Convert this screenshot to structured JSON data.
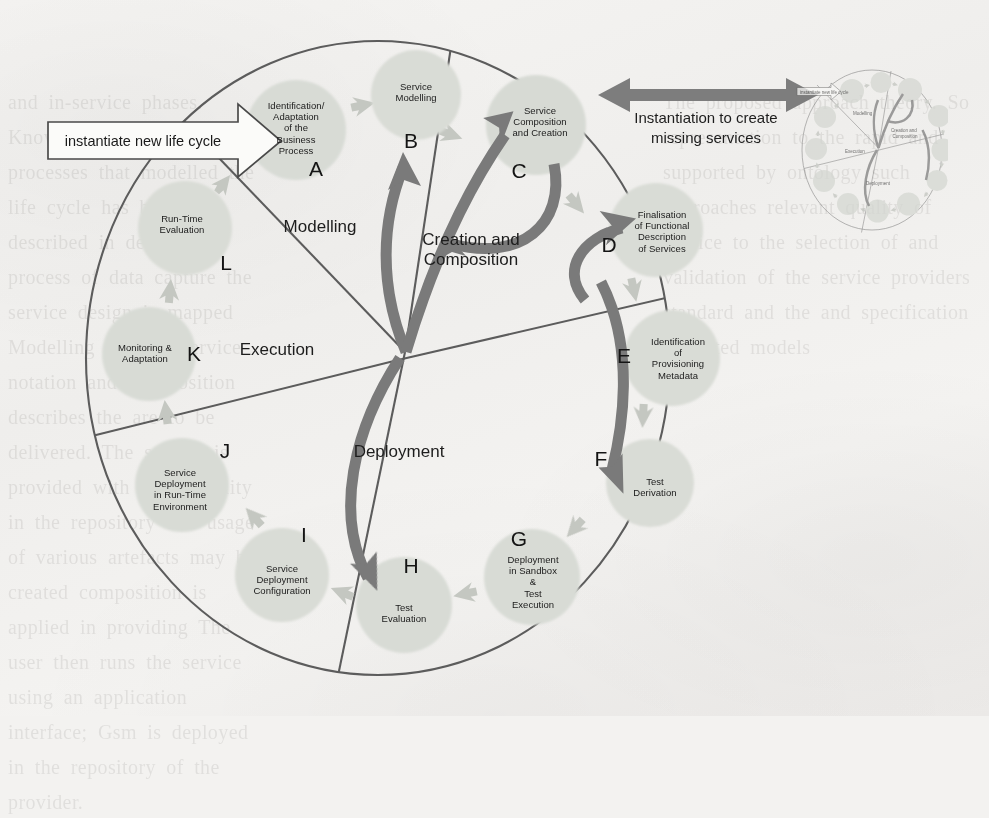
{
  "diagram": {
    "kind": "circular-lifecycle",
    "colors": {
      "node_fill": "#d9dcd6",
      "node_fill_alt": "#dcdfd9",
      "chevron_fill": "#c3c6c0",
      "dark_arrow": "#7b7b7b",
      "outline": "#5f5f5f",
      "text": "#1b1b1b",
      "banner_arrow": "#7d7d7d",
      "paper": "#f3f2f0"
    },
    "sectors": [
      {
        "id": "modelling",
        "label": "Modelling"
      },
      {
        "id": "creation-composition",
        "label": "Creation and\nComposition"
      },
      {
        "id": "execution",
        "label": "Execution"
      },
      {
        "id": "deployment",
        "label": "Deployment"
      }
    ],
    "nodes": [
      {
        "key": "A",
        "label": "Identification/\nAdaptation\nof the\nBusiness\nProcess",
        "sector": "modelling"
      },
      {
        "key": "B",
        "label": "Service\nModelling",
        "sector": "modelling"
      },
      {
        "key": "C",
        "label": "Service\nComposition\nand Creation",
        "sector": "creation-composition"
      },
      {
        "key": "D",
        "label": "Finalisation\nof Functional\nDescription\nof Services",
        "sector": "creation-composition"
      },
      {
        "key": "E",
        "label": "Identification\nof\nProvisioning\nMetadata",
        "sector": "deployment"
      },
      {
        "key": "F",
        "label": "Test\nDerivation",
        "sector": "deployment"
      },
      {
        "key": "G",
        "label": "Deployment\nin Sandbox\n&\nTest\nExecution",
        "sector": "deployment"
      },
      {
        "key": "H",
        "label": "Test\nEvaluation",
        "sector": "deployment"
      },
      {
        "key": "I",
        "label": "Service\nDeployment\nConfiguration",
        "sector": "deployment"
      },
      {
        "key": "J",
        "label": "Service\nDeployment\nin Run-Time\nEnvironment",
        "sector": "execution"
      },
      {
        "key": "K",
        "label": "Monitoring &\nAdaptation",
        "sector": "execution"
      },
      {
        "key": "L",
        "label": "Run-Time\nEvaluation",
        "sector": "execution"
      }
    ],
    "entry_tag": {
      "label": "instantiate new life cycle"
    },
    "feedback_banner": {
      "label": "Instantiation to create\nmissing services"
    },
    "thumbnail": {
      "label": "instantiate new life cycle"
    }
  },
  "ghost_text": {
    "left": "and in-service phases. Knowledge\nneeded to the processes that\nmodelled\n\nthe life cycle has been\ndescribed in detail in\n\nprocess of data capture\n\nthe service design is mapped\nModelling and the service notation\nand Composition describes the\nare to be delivered. The service is\nprovided with compatibility\nin the repository and usage of\nvarious artefacts may be created\n\ncomposition is applied in providing\nThe user then runs the service using\nan application interface; Gsm is deployed\nin the repository of the provider.",
    "right": "The proposed approach\ntheory. So representation\n\nto the rapid and\n\nsupported by ontology\n\nsuch approaches\n\nrelevant quality of service\n\nto the selection of\n\nand validation of the\n\nservice providers\n\nstandard and the\n\nand specification\n\nvalidated models"
  }
}
